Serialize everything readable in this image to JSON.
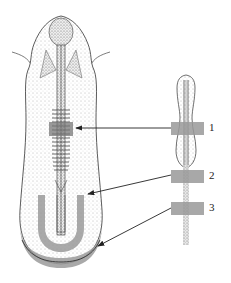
{
  "figure": {
    "labels": [
      {
        "id": "1",
        "text": "1"
      },
      {
        "id": "2",
        "text": "2"
      },
      {
        "id": "3",
        "text": "3"
      }
    ],
    "colors": {
      "outline": "#333333",
      "stipple": "#8a8a8a",
      "graft": "#9a9a9a",
      "background": "#ffffff"
    }
  }
}
